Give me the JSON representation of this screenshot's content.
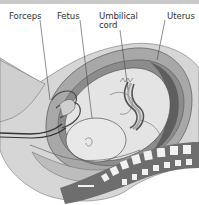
{
  "figure": {
    "labels": {
      "forceps": "Forceps",
      "fetus": "Fetus",
      "umbilical_cord_line1": "Umbilical",
      "umbilical_cord_line2": "cord",
      "uterus": "Uterus"
    },
    "colors": {
      "background": "#ffffff",
      "top_bar": "#c8c8c8",
      "outer_body": "#d6d6d6",
      "uterus_wall": "#a8a8a8",
      "uterus_dark": "#7a7a7a",
      "fetus": "#e4e4e4",
      "outline": "#555555",
      "spine_dark": "#6e6e6e",
      "vertebra": "#f2f2f2",
      "label_text": "#333333"
    }
  }
}
